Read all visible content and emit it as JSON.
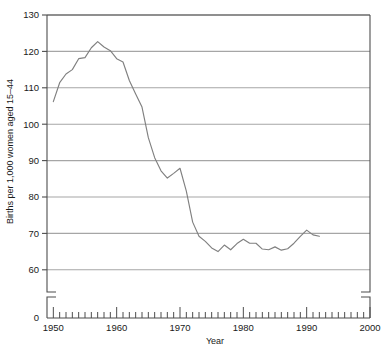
{
  "chart_data": {
    "type": "line",
    "title": "",
    "xlabel": "Year",
    "ylabel": "Births per 1,000 women aged 15–44",
    "xlim": [
      1949,
      2000
    ],
    "ylim": [
      55,
      130
    ],
    "ytick_labels": [
      "0",
      "60",
      "70",
      "80",
      "90",
      "100",
      "110",
      "120",
      "130"
    ],
    "ytick_values": [
      0,
      60,
      70,
      80,
      90,
      100,
      110,
      120,
      130
    ],
    "xtick_labels": [
      "1950",
      "1960",
      "1970",
      "1980",
      "1990",
      "2000"
    ],
    "xtick_values": [
      1950,
      1960,
      1970,
      1980,
      1990,
      2000
    ],
    "grid": "horizontal",
    "legend": "none",
    "axis_break": "y-axis broken between 0 and 55",
    "minor_tick_interval": 1,
    "line_color": "#808080",
    "grid_color": "#a6a6a6",
    "axis_color": "#4d4d4d",
    "x": [
      1950,
      1951,
      1952,
      1953,
      1954,
      1955,
      1956,
      1957,
      1958,
      1959,
      1960,
      1961,
      1962,
      1963,
      1964,
      1965,
      1966,
      1967,
      1968,
      1969,
      1970,
      1971,
      1972,
      1973,
      1974,
      1975,
      1976,
      1977,
      1978,
      1979,
      1980,
      1981,
      1982,
      1983,
      1984,
      1985,
      1986,
      1987,
      1988,
      1989,
      1990,
      1991,
      1992
    ],
    "values": [
      106.2,
      111.4,
      113.8,
      115.0,
      118.0,
      118.3,
      121.0,
      122.7,
      121.2,
      120.2,
      118.0,
      117.1,
      112.0,
      108.3,
      104.7,
      96.3,
      90.8,
      87.2,
      85.2,
      86.5,
      87.9,
      81.6,
      73.1,
      69.2,
      67.8,
      66.0,
      65.0,
      66.8,
      65.5,
      67.2,
      68.4,
      67.3,
      67.3,
      65.7,
      65.5,
      66.3,
      65.4,
      65.8,
      67.3,
      69.2,
      70.9,
      69.6,
      69.2
    ],
    "series_name": "General fertility rate"
  }
}
